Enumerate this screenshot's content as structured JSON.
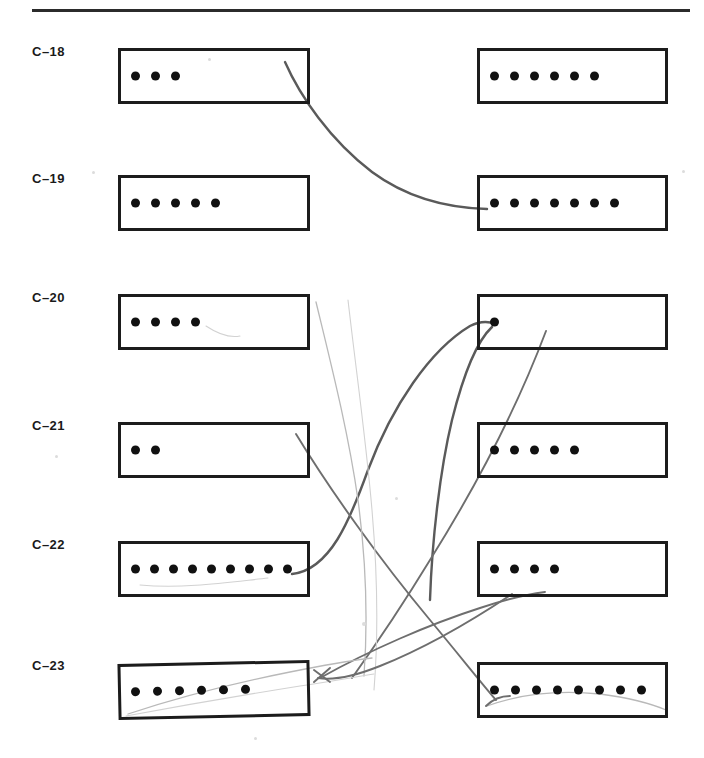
{
  "figure": {
    "divider": "horizontal-rule",
    "page_background": "#ffffff",
    "box_border_color": "#1c1c1c",
    "dot_color": "#111111",
    "connector_colors": [
      "#5a5a5a",
      "#6e6e6e",
      "#b9b9b9",
      "#d2d2d2"
    ]
  },
  "rows": [
    {
      "label": "C–18",
      "top": 48,
      "left_box": {
        "dots": 3
      },
      "right_box": {
        "dots": 6
      }
    },
    {
      "label": "C–19",
      "top": 175,
      "left_box": {
        "dots": 5
      },
      "right_box": {
        "dots": 7
      }
    },
    {
      "label": "C–20",
      "top": 294,
      "left_box": {
        "dots": 4
      },
      "right_box": {
        "dots": 1
      }
    },
    {
      "label": "C–21",
      "top": 422,
      "left_box": {
        "dots": 2
      },
      "right_box": {
        "dots": 5
      }
    },
    {
      "label": "C–22",
      "top": 541,
      "left_box": {
        "dots": 9
      },
      "right_box": {
        "dots": 4
      }
    },
    {
      "label": "C–23",
      "top": 662,
      "left_box": {
        "dots": 6
      },
      "right_box": {
        "dots": 8
      }
    }
  ],
  "connectors": [
    {
      "name": "c18-left-to-c19-right",
      "weight": "dark"
    },
    {
      "name": "c22-left-to-c20-right",
      "weight": "dark"
    },
    {
      "name": "c20-right-to-c23-left",
      "weight": "dark"
    },
    {
      "name": "c21-left-to-c23-right",
      "weight": "mid"
    },
    {
      "name": "c20-left-to-c23-left-long",
      "weight": "light"
    },
    {
      "name": "c22-right-to-c23-left",
      "weight": "mid"
    },
    {
      "name": "c23-right-sweep",
      "weight": "light"
    }
  ]
}
